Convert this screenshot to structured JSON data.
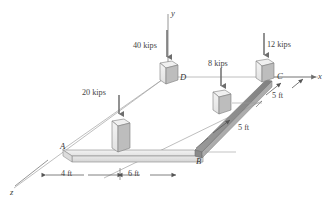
{
  "figure": {
    "background_color": "#ffffff",
    "line_color": "#808080",
    "beam_light_color": "#e6e6e6",
    "beam_dark_color": "#8c8c8c",
    "block_face_color": "#ededed",
    "block_side_color": "#b8b8b8",
    "arrow_color": "#707070"
  },
  "axes": [
    {
      "name": "y-axis",
      "label": "y",
      "direction": "vertical-up"
    },
    {
      "name": "x-axis",
      "label": "x",
      "direction": "right"
    },
    {
      "name": "z-axis",
      "label": "z",
      "direction": "lower-left"
    }
  ],
  "points": [
    {
      "name": "point-a",
      "label": "A"
    },
    {
      "name": "point-b",
      "label": "B"
    },
    {
      "name": "point-c",
      "label": "C"
    },
    {
      "name": "point-d",
      "label": "D"
    }
  ],
  "loads": [
    {
      "name": "load-40-kips",
      "label": "40 kips",
      "magnitude": 40,
      "unit": "kips",
      "direction": "down",
      "applied_at": "D"
    },
    {
      "name": "load-20-kips",
      "label": "20 kips",
      "magnitude": 20,
      "unit": "kips",
      "direction": "down",
      "applied_at": "between A and B"
    },
    {
      "name": "load-8-kips",
      "label": "8 kips",
      "magnitude": 8,
      "unit": "kips",
      "direction": "down",
      "applied_at": "between B and C"
    },
    {
      "name": "load-12-kips",
      "label": "12 kips",
      "magnitude": 12,
      "unit": "kips",
      "direction": "down",
      "applied_at": "C"
    }
  ],
  "dimensions": [
    {
      "name": "dim-4-ft",
      "label": "4 ft",
      "value": 4,
      "unit": "ft",
      "span": "A to 20 kips load"
    },
    {
      "name": "dim-6-ft",
      "label": "6 ft",
      "value": 6,
      "unit": "ft",
      "span": "20 kips load to B"
    },
    {
      "name": "dim-5-ft-lower",
      "label": "5 ft",
      "value": 5,
      "unit": "ft",
      "span": "B to 8 kips load"
    },
    {
      "name": "dim-5-ft-upper",
      "label": "5 ft",
      "value": 5,
      "unit": "ft",
      "span": "8 kips load to C"
    }
  ]
}
